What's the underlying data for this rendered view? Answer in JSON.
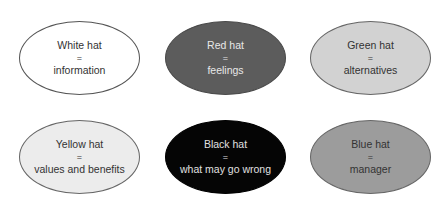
{
  "hats": [
    {
      "id": "white",
      "title": "White hat",
      "equals": "=",
      "meaning": "information",
      "fill": "#ffffff"
    },
    {
      "id": "red",
      "title": "Red hat",
      "equals": "=",
      "meaning": "feelings",
      "fill": "#5c5c5c"
    },
    {
      "id": "green",
      "title": "Green hat",
      "equals": "=",
      "meaning": "alternatives",
      "fill": "#d2d2d2"
    },
    {
      "id": "yellow",
      "title": "Yellow hat",
      "equals": "=",
      "meaning": "values and benefits",
      "fill": "#ececec"
    },
    {
      "id": "black",
      "title": "Black hat",
      "equals": "=",
      "meaning": "what may go wrong",
      "fill": "#050505"
    },
    {
      "id": "blue",
      "title": "Blue hat",
      "equals": "=",
      "meaning": "manager",
      "fill": "#9c9c9c"
    }
  ]
}
